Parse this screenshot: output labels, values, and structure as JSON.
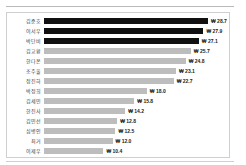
{
  "chart_data": {
    "type": "bar",
    "orientation": "horizontal",
    "title": "",
    "subtitle": "",
    "xlabel": "",
    "ylabel": "",
    "currency_symbol": "₩",
    "xlim": [
      0,
      28.7
    ],
    "grid": false,
    "legend": false,
    "categories": [
      "김준호",
      "이서우",
      "박단비",
      "김교환",
      "한다온",
      "조주울",
      "정진하",
      "박정희",
      "김세민",
      "한진사",
      "김민선",
      "심병인",
      "최거",
      "이제우"
    ],
    "values": [
      28.7,
      27.9,
      27.1,
      25.7,
      24.8,
      23.1,
      22.7,
      18.0,
      15.8,
      14.2,
      12.8,
      12.5,
      12.0,
      10.4
    ],
    "value_labels": [
      "₩ 28.7",
      "₩ 27.9",
      "₩ 27.1",
      "₩ 25.7",
      "₩ 24.8",
      "₩ 23.1",
      "₩ 22.7",
      "₩ 18.0",
      "₩ 15.8",
      "₩ 14.2",
      "₩ 12.8",
      "₩ 12.5",
      "₩ 12.0",
      "₩ 10.4"
    ],
    "highlight_count": 3,
    "colors": {
      "bar_highlight": "#111111",
      "bar_default": "#bdbdbd",
      "label_text": "#3a3a3a",
      "value_text": "#222222",
      "frame": "#cfcfcf",
      "background": "#ffffff"
    }
  }
}
